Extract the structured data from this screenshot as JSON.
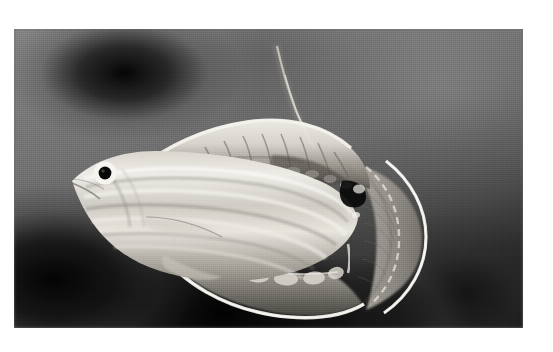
{
  "page": {
    "type": "photographic-plate",
    "background_color": "#ffffff",
    "margin_px": {
      "left": 14,
      "top": 29,
      "right": 30,
      "bottom": 24
    }
  },
  "photo": {
    "name": "fish-photograph",
    "width": 509,
    "height": 299,
    "color_mode": "grayscale",
    "subject": "reef fish in left profile with fins fully spread",
    "orientation": "head facing left, tail at right",
    "background_description": "out-of-focus mottled reef substrate, bright gray at upper right grading to near-black at lower left and bottom",
    "colors": {
      "background_light": "#8b8b8b",
      "background_mid": "#5a5a5a",
      "background_dark": "#141414",
      "body_highlight": "#e8e6e0",
      "body_midtone": "#b9b5ad",
      "body_shadow": "#6f6b64",
      "fin_margin_white": "#f4f2ec",
      "eye_ring_white": "#f6f4ef",
      "eye_pupil_black": "#0d0d0d",
      "dark_spot_black": "#101010"
    }
  },
  "fish": {
    "name": "fish-subject",
    "parts": [
      {
        "id": "snout",
        "label": "snout",
        "approx_xy": [
          58,
          150
        ]
      },
      {
        "id": "eye",
        "label": "eye",
        "approx_xy": [
          91,
          144
        ],
        "ring": "white",
        "pupil": "black"
      },
      {
        "id": "head",
        "label": "head",
        "approx_xy": [
          80,
          155
        ]
      },
      {
        "id": "body",
        "label": "body with longitudinal stripes",
        "approx_xy": [
          200,
          170
        ],
        "stripe_count": 5
      },
      {
        "id": "dorsal-fin",
        "label": "dorsal fin",
        "approx_xy": [
          250,
          115
        ]
      },
      {
        "id": "dorsal-filament",
        "label": "elongate dorsal filament",
        "approx_xy": [
          275,
          40
        ]
      },
      {
        "id": "dorsal-dark-spot",
        "label": "dark spot at rear dorsal base",
        "approx_xy": [
          342,
          157
        ]
      },
      {
        "id": "caudal-fin",
        "label": "caudal fin with white trailing margin",
        "approx_xy": [
          390,
          195
        ]
      },
      {
        "id": "anal-fin",
        "label": "anal fin with white margin and pale ocelli",
        "approx_xy": [
          250,
          255
        ]
      },
      {
        "id": "pelvic-fin",
        "label": "pelvic fin",
        "approx_xy": [
          180,
          230
        ]
      }
    ]
  }
}
